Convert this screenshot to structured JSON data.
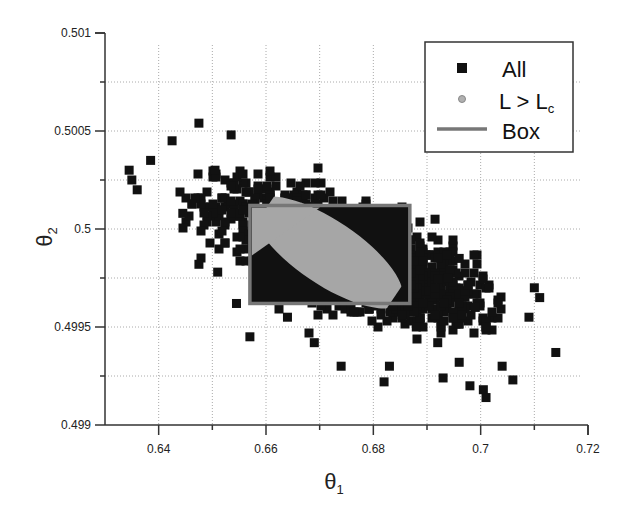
{
  "chart_data": {
    "type": "scatter",
    "title": "",
    "xlabel": "θ1",
    "ylabel": "θ2",
    "xlim": [
      0.63,
      0.72
    ],
    "ylim": [
      0.499,
      0.501
    ],
    "xticks": [
      0.64,
      0.66,
      0.68,
      0.7,
      0.72
    ],
    "xtick_labels": [
      "0.64",
      "0.66",
      "0.68",
      "0.7",
      "0.72"
    ],
    "yticks": [
      0.499,
      0.4995,
      0.5,
      0.5005,
      0.501
    ],
    "ytick_labels": [
      "0.499",
      "0.4995",
      "0.5",
      "0.5005",
      "0.501"
    ],
    "x_minor_gridlines": [
      0.64,
      0.65,
      0.66,
      0.67,
      0.68,
      0.69,
      0.7,
      0.71
    ],
    "y_minor_gridlines": [
      0.49925,
      0.4995,
      0.49975,
      0.5,
      0.50025,
      0.5005,
      0.50075
    ],
    "grid": true,
    "legend": {
      "position": "upper right",
      "entries": [
        {
          "label": "All",
          "marker": "square",
          "color": "#111111"
        },
        {
          "label": "L > L",
          "subscript": "c",
          "marker": "circle",
          "color": "#a6a6a6"
        },
        {
          "label": "Box",
          "marker": "line",
          "color": "#777777"
        }
      ]
    },
    "series": [
      {
        "name": "All",
        "marker": "square",
        "color": "#111111",
        "distribution": "correlated gaussian cloud",
        "center": [
          0.675,
          0.49987
        ],
        "std": [
          0.012,
          0.00017
        ],
        "correlation": -0.72,
        "n_points": 1600,
        "outliers": [
          [
            0.6345,
            0.5003
          ],
          [
            0.635,
            0.50025
          ],
          [
            0.636,
            0.5002
          ],
          [
            0.6385,
            0.50035
          ],
          [
            0.6425,
            0.50045
          ],
          [
            0.6445,
            0.50008
          ],
          [
            0.6475,
            0.50054
          ],
          [
            0.6505,
            0.5003
          ],
          [
            0.6535,
            0.50048
          ],
          [
            0.6475,
            0.49982
          ],
          [
            0.651,
            0.49978
          ],
          [
            0.6545,
            0.49962
          ],
          [
            0.657,
            0.49945
          ],
          [
            0.664,
            0.49955
          ],
          [
            0.669,
            0.49942
          ],
          [
            0.674,
            0.4993
          ],
          [
            0.682,
            0.49922
          ],
          [
            0.683,
            0.4993
          ],
          [
            0.688,
            0.4995
          ],
          [
            0.692,
            0.49942
          ],
          [
            0.693,
            0.49924
          ],
          [
            0.696,
            0.49932
          ],
          [
            0.698,
            0.4992
          ],
          [
            0.7005,
            0.49918
          ],
          [
            0.701,
            0.49914
          ],
          [
            0.704,
            0.4993
          ],
          [
            0.706,
            0.49923
          ],
          [
            0.701,
            0.4995
          ],
          [
            0.699,
            0.4996
          ],
          [
            0.709,
            0.49955
          ],
          [
            0.71,
            0.4997
          ],
          [
            0.711,
            0.49965
          ],
          [
            0.714,
            0.49937
          ],
          [
            0.696,
            0.49985
          ],
          [
            0.6915,
            0.50005
          ],
          [
            0.694,
            0.49975
          ]
        ]
      },
      {
        "name": "L > Lc",
        "marker": "circle",
        "color": "#a6a6a6",
        "distribution": "ellipse region",
        "center": [
          0.6715,
          0.49988
        ],
        "semi_axes_px": [
          88,
          32
        ],
        "rotation_deg": 34
      },
      {
        "name": "Box",
        "type": "rectangle",
        "color": "#777777",
        "x_range": [
          0.657,
          0.6868
        ],
        "y_range": [
          0.49962,
          0.50012
        ]
      }
    ]
  }
}
